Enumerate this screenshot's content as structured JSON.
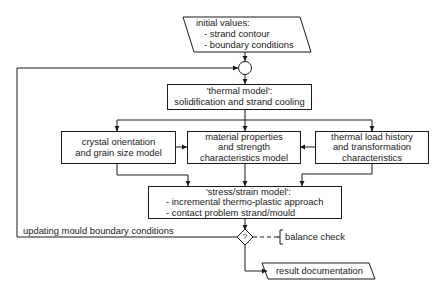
{
  "input": {
    "title": "initial values:",
    "items": [
      "- strand contour",
      "- boundary conditions"
    ]
  },
  "thermal_model": {
    "title": "'thermal model':",
    "subtitle": "solidification and strand cooling"
  },
  "crystal_model": {
    "lines": [
      "crystal orientation",
      "and grain size model"
    ]
  },
  "material_model": {
    "lines": [
      "material properties",
      "and strength",
      "characteristics model"
    ]
  },
  "thermal_load": {
    "lines": [
      "thermal load history",
      "and transformation",
      "characteristics"
    ]
  },
  "stress_model": {
    "title": "'stress/strain model':",
    "items": [
      "- incremental thermo-plastic approach",
      "- contact problem strand/mould"
    ]
  },
  "loop_label": "updating mould boundary conditions",
  "decision": {
    "symbol": "?",
    "annotation": "balance check"
  },
  "output": {
    "label": "result documentation"
  },
  "colors": {
    "line": "#1a1a1a",
    "background": "#ffffff"
  }
}
